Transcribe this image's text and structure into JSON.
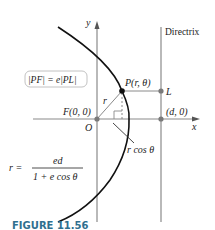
{
  "figure": {
    "caption": "FIGURE 11.56",
    "axes": {
      "x_label": "x",
      "y_label": "y",
      "origin_label": "O"
    },
    "directrix_label": "Directrix",
    "points": {
      "focus": "F(0, 0)",
      "P": "P(r, θ)",
      "L": "L",
      "d": "(d, 0)"
    },
    "segment_labels": {
      "r": "r",
      "r_cos": "r cos θ"
    },
    "boxed_equation": "|PF| = e|PL|",
    "polar_equation": {
      "lhs": "r =",
      "numerator": "ed",
      "denominator": "1 + e cos θ"
    },
    "colors": {
      "axis": "#8a8a8a",
      "curve": "#111111",
      "point": "#7a7a7a",
      "caption": "#2f6f8f"
    }
  }
}
